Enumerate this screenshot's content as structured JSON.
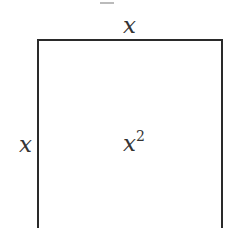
{
  "diagram": {
    "type": "square-area",
    "top_label": "x",
    "left_label": "x",
    "area_label_base": "x",
    "area_label_exponent": "2",
    "stroke_color": "#2a2a2a"
  }
}
